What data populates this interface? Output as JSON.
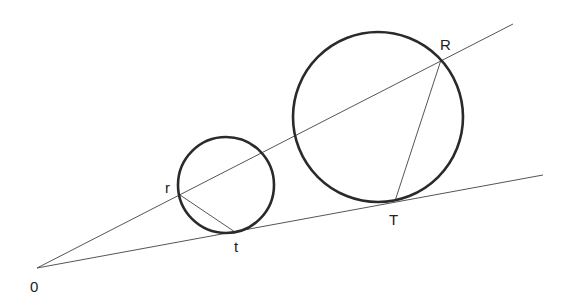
{
  "diagram": {
    "colors": {
      "stroke": "#2a2a2a",
      "line": "#555555",
      "background": "#ffffff"
    },
    "origin": {
      "label": "0",
      "x": 37,
      "y": 268,
      "label_x": 30,
      "label_y": 292
    },
    "rays": [
      {
        "name": "upper-ray",
        "x1": 37,
        "y1": 268,
        "x2": 513,
        "y2": 24
      },
      {
        "name": "lower-ray",
        "x1": 37,
        "y1": 268,
        "x2": 543,
        "y2": 175
      }
    ],
    "circles": [
      {
        "name": "small-circle",
        "cx": 226,
        "cy": 185,
        "r": 48
      },
      {
        "name": "large-circle",
        "cx": 378,
        "cy": 117,
        "r": 85
      }
    ],
    "points": [
      {
        "label": "r",
        "x": 180,
        "y": 195,
        "label_x": 165,
        "label_y": 193
      },
      {
        "label": "t",
        "x": 235,
        "y": 232,
        "label_x": 234,
        "label_y": 252
      },
      {
        "label": "R",
        "x": 441,
        "y": 60,
        "label_x": 440,
        "label_y": 50
      },
      {
        "label": "T",
        "x": 395,
        "y": 201,
        "label_x": 389,
        "label_y": 225
      }
    ],
    "segments": [
      {
        "name": "segment-r-t",
        "from": "r",
        "to": "t"
      },
      {
        "name": "segment-R-T",
        "from": "R",
        "to": "T"
      }
    ]
  }
}
